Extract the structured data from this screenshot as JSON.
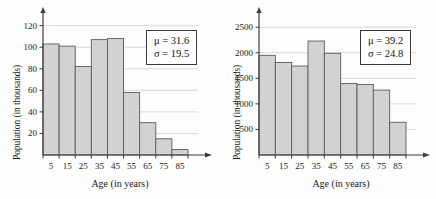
{
  "chart_data": [
    {
      "id": "left",
      "type": "bar",
      "title": "",
      "xlabel": "Age (in years)",
      "ylabel": "Population (in thousands)",
      "categories": [
        "5",
        "15",
        "25",
        "35",
        "45",
        "55",
        "65",
        "75",
        "85"
      ],
      "values": [
        103,
        101,
        82,
        107,
        108,
        58,
        30,
        15,
        5
      ],
      "yticks": [
        20,
        40,
        60,
        80,
        100,
        120
      ],
      "ylim": [
        0,
        128
      ],
      "xlim": [
        0,
        90
      ],
      "grid": true,
      "legend": "none",
      "annotations": {
        "mu_label": "μ = 31.6",
        "sigma_label": "σ = 19.5",
        "mu": 31.6,
        "sigma": 19.5
      }
    },
    {
      "id": "right",
      "type": "bar",
      "title": "",
      "xlabel": "Age (in years)",
      "ylabel": "Population (in thousands)",
      "categories": [
        "5",
        "15",
        "25",
        "35",
        "45",
        "55",
        "65",
        "75",
        "85"
      ],
      "values": [
        1950,
        1810,
        1740,
        2230,
        1990,
        1400,
        1380,
        1270,
        640
      ],
      "yticks": [
        500,
        1000,
        1500,
        2000,
        2500
      ],
      "ylim": [
        0,
        2700
      ],
      "xlim": [
        0,
        90
      ],
      "grid": true,
      "legend": "none",
      "annotations": {
        "mu_label": "μ = 39.2",
        "sigma_label": "σ = 24.8",
        "mu": 39.2,
        "sigma": 24.8
      }
    }
  ],
  "style": {
    "bar_fill": "#d2d2d2",
    "bar_stroke": "#5a5a5a",
    "axis_color": "#3c3c3c",
    "grid_color": "#cfcfcf",
    "text_color": "#1a1a1a"
  }
}
